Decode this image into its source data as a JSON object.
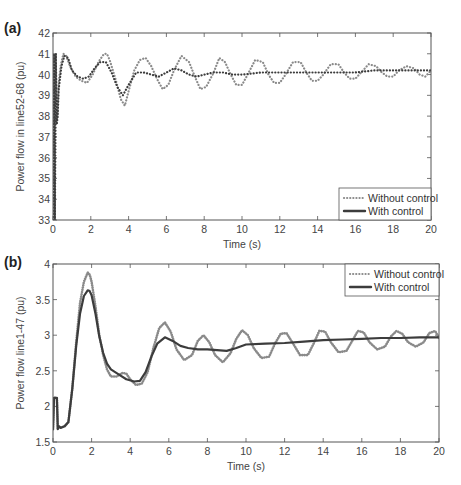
{
  "chart_data": [
    {
      "panel_label": "(a)",
      "type": "line",
      "title": "",
      "xlabel": "Time (s)",
      "ylabel": "Power flow in line52-68 (pu)",
      "xlim": [
        0,
        20
      ],
      "ylim": [
        33,
        42
      ],
      "xticks": [
        0,
        2,
        4,
        6,
        8,
        10,
        12,
        14,
        16,
        18,
        20
      ],
      "yticks": [
        33,
        34,
        35,
        36,
        37,
        38,
        39,
        40,
        41,
        42
      ],
      "grid": false,
      "legend_position": "lower right",
      "series": [
        {
          "name": "Without control",
          "style": "dotted",
          "color": "#8a8a8a",
          "x": [
            0,
            0.05,
            0.1,
            0.15,
            0.2,
            0.25,
            0.3,
            0.4,
            0.55,
            0.7,
            0.9,
            1.2,
            1.5,
            1.8,
            2.1,
            2.4,
            2.7,
            2.85,
            3.0,
            3.3,
            3.6,
            3.8,
            4.0,
            4.3,
            4.6,
            4.9,
            5.2,
            5.5,
            5.8,
            6.1,
            6.4,
            6.8,
            7.2,
            7.5,
            7.8,
            8.1,
            8.5,
            8.8,
            9.1,
            9.4,
            9.7,
            10.0,
            10.3,
            10.7,
            11.1,
            11.4,
            11.7,
            12.0,
            12.3,
            12.7,
            13.1,
            13.4,
            13.7,
            14.0,
            14.3,
            14.7,
            15.1,
            15.4,
            15.7,
            16.0,
            16.3,
            16.7,
            17.1,
            17.4,
            17.7,
            18.0,
            18.3,
            18.7,
            19.1,
            19.4,
            19.7,
            20.0
          ],
          "y": [
            33.0,
            41.0,
            33.0,
            41.0,
            37.8,
            38.2,
            39.6,
            40.4,
            41.0,
            40.9,
            40.4,
            39.9,
            39.7,
            39.6,
            40.0,
            40.6,
            41.0,
            41.0,
            40.7,
            39.8,
            38.8,
            38.5,
            39.2,
            40.2,
            40.7,
            40.8,
            40.4,
            39.8,
            39.3,
            39.5,
            40.2,
            40.9,
            40.6,
            39.9,
            39.3,
            39.4,
            40.1,
            40.8,
            40.6,
            40.0,
            39.5,
            39.5,
            40.0,
            40.7,
            40.6,
            40.0,
            39.6,
            39.6,
            40.0,
            40.6,
            40.6,
            40.1,
            39.7,
            39.7,
            40.0,
            40.5,
            40.5,
            40.1,
            39.8,
            39.8,
            40.1,
            40.5,
            40.4,
            40.1,
            39.9,
            39.9,
            40.2,
            40.4,
            40.3,
            40.0,
            39.9,
            40.2
          ]
        },
        {
          "name": "With control",
          "style": "solid",
          "color": "#3c3c3c",
          "x": [
            0,
            0.05,
            0.1,
            0.15,
            0.2,
            0.25,
            0.3,
            0.45,
            0.6,
            0.8,
            1.0,
            1.3,
            1.6,
            1.9,
            2.2,
            2.5,
            2.8,
            3.1,
            3.4,
            3.7,
            4.0,
            4.4,
            4.8,
            5.2,
            5.6,
            6.0,
            6.4,
            6.8,
            7.2,
            7.6,
            8.0,
            8.5,
            9.0,
            9.5,
            10.0,
            11.0,
            12.0,
            13.0,
            14.0,
            15.0,
            16.0,
            17.0,
            18.0,
            19.0,
            20.0
          ],
          "y": [
            33.0,
            41.0,
            33.0,
            41.0,
            37.6,
            38.0,
            39.3,
            40.4,
            40.9,
            40.8,
            40.2,
            39.9,
            39.8,
            39.9,
            40.3,
            40.6,
            40.6,
            40.1,
            39.4,
            39.0,
            39.5,
            40.1,
            40.1,
            40.0,
            39.9,
            40.1,
            40.3,
            40.2,
            40.0,
            39.9,
            40.0,
            40.1,
            40.1,
            40.0,
            40.0,
            40.1,
            40.1,
            40.1,
            40.1,
            40.1,
            40.1,
            40.2,
            40.2,
            40.2,
            40.2
          ]
        }
      ]
    },
    {
      "panel_label": "(b)",
      "type": "line",
      "title": "",
      "xlabel": "Time (s)",
      "ylabel": "Power flow line1-47 (pu)",
      "xlim": [
        0,
        20
      ],
      "ylim": [
        1.5,
        4
      ],
      "xticks": [
        0,
        2,
        4,
        6,
        8,
        10,
        12,
        14,
        16,
        18,
        20
      ],
      "yticks": [
        1.5,
        2,
        2.5,
        3,
        3.5,
        4
      ],
      "grid": false,
      "legend_position": "upper right",
      "series": [
        {
          "name": "Without control",
          "style": "dotted",
          "color": "#8a8a8a",
          "x": [
            0,
            0.05,
            0.1,
            0.2,
            0.25,
            0.3,
            0.4,
            0.6,
            0.8,
            1.0,
            1.2,
            1.4,
            1.6,
            1.8,
            1.9,
            2.0,
            2.2,
            2.4,
            2.6,
            2.8,
            3.0,
            3.3,
            3.6,
            3.8,
            4.0,
            4.3,
            4.6,
            4.9,
            5.2,
            5.5,
            5.8,
            6.1,
            6.4,
            6.8,
            7.2,
            7.5,
            7.8,
            8.1,
            8.4,
            8.8,
            9.2,
            9.5,
            9.8,
            10.1,
            10.4,
            10.8,
            11.2,
            11.5,
            11.8,
            12.1,
            12.4,
            12.8,
            13.2,
            13.5,
            13.8,
            14.1,
            14.4,
            14.8,
            15.2,
            15.5,
            15.8,
            16.1,
            16.4,
            16.8,
            17.2,
            17.5,
            17.8,
            18.1,
            18.4,
            18.8,
            19.2,
            19.5,
            19.8,
            20.0
          ],
          "y": [
            1.68,
            2.12,
            2.12,
            2.12,
            1.68,
            1.72,
            1.7,
            1.72,
            1.78,
            2.25,
            2.9,
            3.45,
            3.75,
            3.88,
            3.85,
            3.75,
            3.4,
            3.0,
            2.72,
            2.52,
            2.42,
            2.42,
            2.47,
            2.46,
            2.38,
            2.3,
            2.32,
            2.48,
            2.82,
            3.1,
            3.18,
            3.05,
            2.8,
            2.65,
            2.72,
            2.92,
            3.0,
            2.9,
            2.72,
            2.62,
            2.75,
            2.95,
            3.07,
            3.0,
            2.82,
            2.68,
            2.7,
            2.88,
            3.02,
            3.03,
            2.9,
            2.72,
            2.72,
            2.88,
            3.06,
            3.05,
            2.9,
            2.76,
            2.78,
            2.92,
            3.06,
            3.04,
            2.9,
            2.8,
            2.84,
            2.98,
            3.06,
            3.02,
            2.9,
            2.84,
            2.9,
            3.03,
            3.06,
            2.96
          ]
        },
        {
          "name": "With control",
          "style": "solid",
          "color": "#3c3c3c",
          "x": [
            0,
            0.05,
            0.1,
            0.2,
            0.25,
            0.3,
            0.4,
            0.6,
            0.8,
            1.0,
            1.2,
            1.4,
            1.6,
            1.8,
            1.9,
            2.0,
            2.2,
            2.4,
            2.6,
            2.8,
            3.0,
            3.4,
            3.8,
            4.2,
            4.5,
            4.8,
            5.1,
            5.4,
            5.8,
            6.2,
            6.6,
            7.0,
            7.5,
            8.0,
            8.5,
            9.0,
            9.5,
            10.0,
            11.0,
            12.0,
            13.0,
            14.0,
            15.0,
            16.0,
            17.0,
            18.0,
            19.0,
            20.0
          ],
          "y": [
            1.68,
            2.12,
            2.12,
            2.12,
            1.68,
            1.72,
            1.7,
            1.72,
            1.78,
            2.25,
            2.85,
            3.3,
            3.55,
            3.63,
            3.62,
            3.56,
            3.3,
            2.98,
            2.75,
            2.6,
            2.52,
            2.45,
            2.38,
            2.35,
            2.36,
            2.48,
            2.7,
            2.88,
            2.97,
            2.92,
            2.85,
            2.82,
            2.8,
            2.8,
            2.79,
            2.78,
            2.82,
            2.87,
            2.88,
            2.89,
            2.91,
            2.93,
            2.94,
            2.95,
            2.96,
            2.96,
            2.97,
            2.97
          ]
        }
      ]
    }
  ],
  "panels": {
    "a": {
      "label": "(a)",
      "ylabel": "Power flow in line52-68 (pu)",
      "xlabel": "Time (s)",
      "legend": [
        "Without control",
        "With control"
      ]
    },
    "b": {
      "label": "(b)",
      "ylabel": "Power flow line1-47 (pu)",
      "xlabel": "Time (s)",
      "legend": [
        "Without control",
        "With control"
      ]
    }
  }
}
